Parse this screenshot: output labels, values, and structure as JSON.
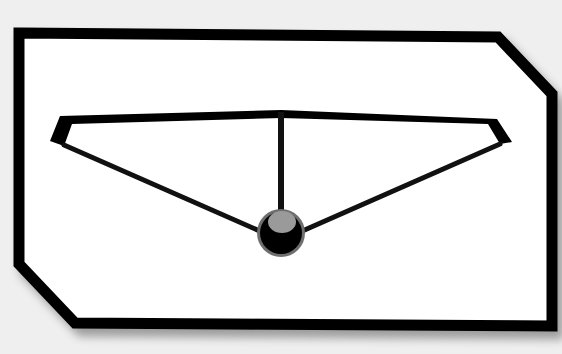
{
  "scene": {
    "description": "Hanger-like glyph inside a chamfered frame",
    "colors": {
      "background": "#efefef",
      "frame_fill": "#ffffff",
      "frame_stroke": "#000000",
      "line": "#111111",
      "knob_outer": "#000000",
      "knob_ring": "#6e6e6e",
      "knob_highlight": "#9a9a9a",
      "shadow": "#bdbdbd"
    }
  }
}
